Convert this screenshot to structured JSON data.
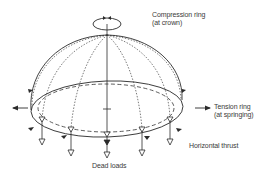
{
  "diagram": {
    "type": "structural-dome-forces",
    "labels": {
      "compression_ring": {
        "line1": "Compression ring",
        "line2": "(at crown)"
      },
      "tension_ring": {
        "line1": "Tension ring",
        "line2": "(at springing)"
      },
      "horizontal_thrust": "Horizontal thrust",
      "dead_loads": "Dead loads"
    },
    "colors": {
      "stroke": "#2b2b2b",
      "text": "#3a3a3a",
      "background": "#ffffff"
    },
    "elements": [
      "crown-compression-ring",
      "dome-outline",
      "springing-tension-ring",
      "inner-dashed-ring",
      "dotted-meridians",
      "central-axis",
      "horizontal-thrust-arrows",
      "dead-load-arrows"
    ]
  }
}
